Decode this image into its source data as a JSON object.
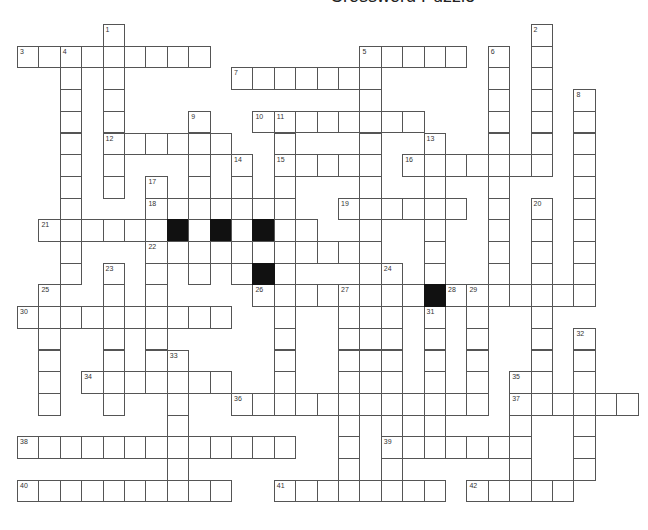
{
  "puzzle": {
    "title": "Crossword Puzzle",
    "grid": {
      "origin_x": 17,
      "origin_y": 24,
      "cell_w": 21.4,
      "cell_h": 21.7
    },
    "across": [
      {
        "num": "3",
        "col": 0,
        "row": 1,
        "len": 9
      },
      {
        "num": "5",
        "col": 16,
        "row": 1,
        "len": 5
      },
      {
        "num": "7",
        "col": 10,
        "row": 2,
        "len": 7
      },
      {
        "num": "10",
        "col": 11,
        "row": 4,
        "len": 8
      },
      {
        "num": "12",
        "col": 4,
        "row": 5,
        "len": 6
      },
      {
        "num": "15",
        "col": 12,
        "row": 6,
        "len": 5
      },
      {
        "num": "16",
        "col": 18,
        "row": 6,
        "len": 7
      },
      {
        "num": "18",
        "col": 6,
        "row": 8,
        "len": 7
      },
      {
        "num": "19",
        "col": 15,
        "row": 8,
        "len": 6
      },
      {
        "num": "21",
        "col": 1,
        "row": 9,
        "len": 13
      },
      {
        "num": "22",
        "col": 6,
        "row": 10,
        "len": 11
      },
      {
        "num": "26",
        "col": 11,
        "row": 12,
        "len": 8
      },
      {
        "num": "28",
        "col": 20,
        "row": 12,
        "len": 7
      },
      {
        "num": "30",
        "col": 0,
        "row": 13,
        "len": 10
      },
      {
        "num": "34",
        "col": 3,
        "row": 16,
        "len": 7
      },
      {
        "num": "36",
        "col": 10,
        "row": 17,
        "len": 12
      },
      {
        "num": "37",
        "col": 23,
        "row": 17,
        "len": 6
      },
      {
        "num": "38",
        "col": 0,
        "row": 19,
        "len": 13
      },
      {
        "num": "39",
        "col": 17,
        "row": 19,
        "len": 7
      },
      {
        "num": "40",
        "col": 0,
        "row": 21,
        "len": 10
      },
      {
        "num": "41",
        "col": 12,
        "row": 21,
        "len": 8
      },
      {
        "num": "42",
        "col": 21,
        "row": 21,
        "len": 5
      }
    ],
    "down": [
      {
        "num": "1",
        "col": 4,
        "row": 0,
        "len": 8
      },
      {
        "num": "2",
        "col": 24,
        "row": 0,
        "len": 7
      },
      {
        "num": "4",
        "col": 2,
        "row": 1,
        "len": 11
      },
      {
        "num": "5",
        "col": 16,
        "row": 1,
        "len": 16
      },
      {
        "num": "6",
        "col": 22,
        "row": 1,
        "len": 11
      },
      {
        "num": "8",
        "col": 26,
        "row": 3,
        "len": 10
      },
      {
        "num": "9",
        "col": 8,
        "row": 4,
        "len": 8
      },
      {
        "num": "11",
        "col": 12,
        "row": 4,
        "len": 13
      },
      {
        "num": "13",
        "col": 19,
        "row": 5,
        "len": 7
      },
      {
        "num": "14",
        "col": 10,
        "row": 6,
        "len": 6
      },
      {
        "num": "17",
        "col": 6,
        "row": 7,
        "len": 9
      },
      {
        "num": "20",
        "col": 24,
        "row": 8,
        "len": 9
      },
      {
        "num": "23",
        "col": 4,
        "row": 11,
        "len": 7
      },
      {
        "num": "24",
        "col": 17,
        "row": 11,
        "len": 11
      },
      {
        "num": "25",
        "col": 1,
        "row": 12,
        "len": 6
      },
      {
        "num": "27",
        "col": 15,
        "row": 12,
        "len": 10
      },
      {
        "num": "29",
        "col": 21,
        "row": 12,
        "len": 6
      },
      {
        "num": "31",
        "col": 19,
        "row": 13,
        "len": 7
      },
      {
        "num": "32",
        "col": 26,
        "row": 14,
        "len": 7
      },
      {
        "num": "33",
        "col": 7,
        "row": 15,
        "len": 7
      },
      {
        "num": "35",
        "col": 23,
        "row": 16,
        "len": 6
      }
    ],
    "black": [
      [
        7,
        9
      ],
      [
        9,
        9
      ],
      [
        11,
        9
      ],
      [
        11,
        11
      ],
      [
        19,
        12
      ]
    ]
  }
}
